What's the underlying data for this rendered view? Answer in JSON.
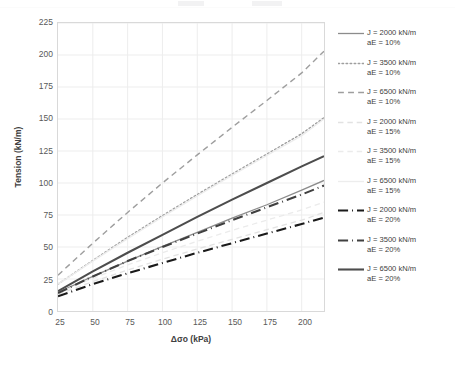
{
  "chart_data": {
    "type": "line",
    "title": "",
    "xlabel": "Δσo (kPa)",
    "ylabel": "Tension (kN/m)",
    "xlim": [
      25,
      216
    ],
    "ylim": [
      0,
      225
    ],
    "xticks": [
      25,
      50,
      75,
      100,
      125,
      150,
      175,
      200
    ],
    "yticks": [
      0,
      25,
      50,
      75,
      100,
      125,
      150,
      175,
      200,
      225
    ],
    "grid": true,
    "legend_position": "right",
    "x": [
      25,
      50,
      75,
      100,
      125,
      150,
      175,
      200,
      216
    ],
    "series": [
      {
        "name": "J = 2000 kN/m aE = 10%",
        "J": 2000,
        "aE": "10%",
        "style": "solid",
        "color": "#8c8c8c",
        "width": 1.3,
        "values": [
          14.5,
          27.0,
          39.0,
          50.5,
          61.5,
          72.5,
          83.0,
          94.5,
          102.0
        ]
      },
      {
        "name": "J = 3500 kN/m aE = 10%",
        "J": 3500,
        "aE": "10%",
        "style": "dotted",
        "color": "#9e9e9e",
        "width": 1.5,
        "values": [
          21.0,
          39.5,
          57.5,
          74.5,
          91.0,
          107.0,
          122.5,
          138.5,
          151.0
        ]
      },
      {
        "name": "J = 6500 kN/m aE = 10%",
        "J": 6500,
        "aE": "10%",
        "style": "dashed",
        "color": "#9e9e9e",
        "width": 1.4,
        "values": [
          28.0,
          53.0,
          77.0,
          100.0,
          122.0,
          143.5,
          164.5,
          186.0,
          203.0
        ]
      },
      {
        "name": "J = 2000 kN/m aE = 15%",
        "J": 2000,
        "aE": "15%",
        "style": "dashed",
        "color": "#e2e2e2",
        "width": 1.3,
        "values": [
          13.0,
          23.0,
          32.0,
          40.5,
          48.5,
          56.0,
          63.5,
          71.0,
          77.0
        ]
      },
      {
        "name": "J = 3500 kN/m aE = 15%",
        "J": 3500,
        "aE": "15%",
        "style": "dashed",
        "color": "#ebebeb",
        "width": 1.3,
        "values": [
          14.0,
          25.5,
          36.0,
          45.5,
          54.5,
          63.0,
          71.0,
          79.0,
          85.0
        ]
      },
      {
        "name": "J = 6500 kN/m aE = 15%",
        "J": 6500,
        "aE": "15%",
        "style": "solid",
        "color": "#ededed",
        "width": 1.4,
        "values": [
          21.0,
          39.0,
          56.5,
          73.5,
          90.0,
          106.0,
          121.5,
          137.0,
          150.0
        ]
      },
      {
        "name": "J = 2000 kN/m aE = 20%",
        "J": 2000,
        "aE": "20%",
        "style": "dashdot",
        "color": "#1a1a1a",
        "width": 2.1,
        "values": [
          11.5,
          21.0,
          29.5,
          37.5,
          45.5,
          53.0,
          60.5,
          68.0,
          73.0
        ]
      },
      {
        "name": "J = 3500 kN/m aE = 20%",
        "J": 3500,
        "aE": "20%",
        "style": "dashdot",
        "color": "#404040",
        "width": 2.1,
        "values": [
          14.0,
          27.0,
          39.0,
          50.0,
          60.5,
          71.0,
          81.0,
          91.0,
          98.0
        ]
      },
      {
        "name": "J = 6500 kN/m aE = 20%",
        "J": 6500,
        "aE": "20%",
        "style": "solid",
        "color": "#4d4d4d",
        "width": 2.1,
        "values": [
          15.5,
          31.0,
          45.5,
          59.5,
          73.5,
          87.0,
          100.0,
          113.0,
          121.0
        ]
      }
    ]
  },
  "axes": {
    "ylabel": "Tension (kN/m)",
    "xlabel": "Δσo (kPa)",
    "yticks": [
      "225",
      "200",
      "175",
      "150",
      "125",
      "100",
      "75",
      "50",
      "25",
      "0"
    ],
    "xticks": [
      "25",
      "50",
      "75",
      "100",
      "125",
      "150",
      "175",
      "200"
    ]
  },
  "legend": {
    "items": [
      {
        "line1": "J = 2000 kN/m",
        "line2": "aE = 10%",
        "style": "solid",
        "color": "#8c8c8c",
        "width": 1.3
      },
      {
        "line1": "J = 3500 kN/m",
        "line2": "aE = 10%",
        "style": "dotted",
        "color": "#9e9e9e",
        "width": 1.5
      },
      {
        "line1": "J = 6500 kN/m",
        "line2": "aE = 10%",
        "style": "dashed",
        "color": "#9e9e9e",
        "width": 1.4
      },
      {
        "line1": "J = 2000 kN/m",
        "line2": "aE = 15%",
        "style": "dashed",
        "color": "#e2e2e2",
        "width": 1.3
      },
      {
        "line1": "J = 3500 kN/m",
        "line2": "aE = 15%",
        "style": "dashed",
        "color": "#ebebeb",
        "width": 1.3
      },
      {
        "line1": "J = 6500 kN/m",
        "line2": "aE = 15%",
        "style": "solid",
        "color": "#ededed",
        "width": 1.4
      },
      {
        "line1": "J = 2000 kN/m",
        "line2": "aE = 20%",
        "style": "dashdot",
        "color": "#1a1a1a",
        "width": 2.1
      },
      {
        "line1": "J = 3500 kN/m",
        "line2": "aE = 20%",
        "style": "dashdot",
        "color": "#404040",
        "width": 2.1
      },
      {
        "line1": "J = 6500 kN/m",
        "line2": "aE = 20%",
        "style": "solid",
        "color": "#4d4d4d",
        "width": 2.1
      }
    ]
  },
  "style": {
    "grid_color": "#ededed",
    "frame_color": "#d9d9d9",
    "tick_text_color": "#595959",
    "title_text_color": "#404040",
    "background": "#ffffff"
  }
}
